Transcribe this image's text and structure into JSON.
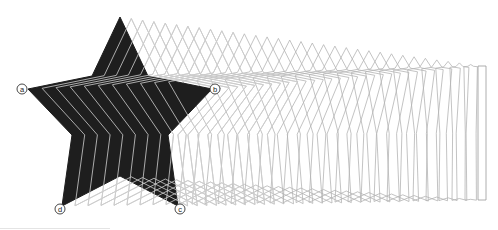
{
  "diagram": {
    "title": "",
    "star": {
      "fill": "#1e1e1e",
      "stroke": "#1e1e1e",
      "vertices": [
        [
          120,
          17
        ],
        [
          148,
          76
        ],
        [
          212,
          89
        ],
        [
          168,
          135
        ],
        [
          178,
          206
        ],
        [
          120,
          176
        ],
        [
          62,
          206
        ],
        [
          72,
          135
        ],
        [
          28,
          89
        ],
        [
          92,
          76
        ]
      ]
    },
    "target_rect": {
      "stroke": "#9a9a9a",
      "vertices": [
        [
          482,
          66
        ],
        [
          484,
          66
        ],
        [
          486,
          66
        ],
        [
          486,
          133
        ],
        [
          486,
          200
        ],
        [
          482,
          200
        ],
        [
          478,
          200
        ],
        [
          478,
          133
        ],
        [
          478,
          66
        ],
        [
          480,
          66
        ]
      ]
    },
    "frames": 32,
    "frame_stroke": "#b4b4b4",
    "labels": [
      {
        "id": "a",
        "text": "a",
        "x": 22,
        "y": 89
      },
      {
        "id": "b",
        "text": "b",
        "x": 215,
        "y": 89
      },
      {
        "id": "c",
        "text": "c",
        "x": 180,
        "y": 209
      },
      {
        "id": "d",
        "text": "d",
        "x": 60,
        "y": 209
      }
    ],
    "label_style": {
      "fill": "#ffffff",
      "stroke": "#333333",
      "text_color": "#222222"
    }
  }
}
